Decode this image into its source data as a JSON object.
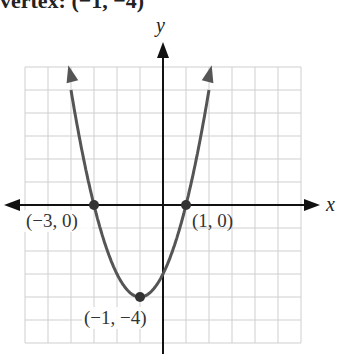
{
  "header": {
    "clipped_text": "vertex: (−1, −4)"
  },
  "chart_data": {
    "type": "line",
    "title": "",
    "function": "y = (x + 1)^2 - 4",
    "xlabel": "x",
    "ylabel": "y",
    "xlim": [
      -6,
      6
    ],
    "ylim": [
      -6,
      6
    ],
    "grid": true,
    "series": [
      {
        "name": "parabola",
        "x": [
          -3.5,
          -3,
          -2,
          -1,
          0,
          1,
          1.5
        ],
        "y": [
          2.25,
          0,
          -3,
          -4,
          -3,
          0,
          2.25
        ]
      }
    ],
    "points": [
      {
        "x": -3,
        "y": 0,
        "label": "(−3, 0)"
      },
      {
        "x": 1,
        "y": 0,
        "label": "(1, 0)"
      },
      {
        "x": -1,
        "y": -4,
        "label": "(−1, −4)"
      }
    ],
    "annotations": [
      "(−3, 0)",
      "(1, 0)",
      "(−1, −4)"
    ]
  },
  "labels": {
    "x_axis": "x",
    "y_axis": "y",
    "p1": "(−3, 0)",
    "p2": "(1, 0)",
    "p3": "(−1, −4)"
  },
  "colors": {
    "curve": "#555555",
    "axis": "#111111",
    "grid": "#cfcfcf"
  }
}
